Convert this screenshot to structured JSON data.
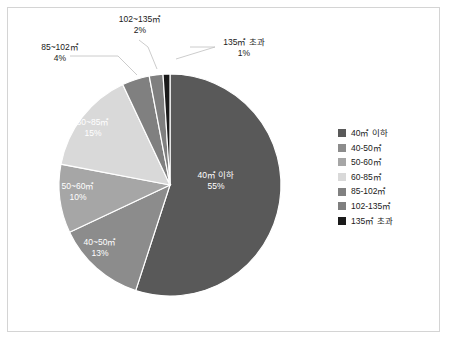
{
  "chart_data": {
    "type": "pie",
    "title": "",
    "categories": [
      "40㎡ 이하",
      "40~50㎡",
      "50~60㎡",
      "60~85㎡",
      "85~102㎡",
      "102~135㎡",
      "135㎡ 초과"
    ],
    "values": [
      55,
      13,
      10,
      15,
      4,
      2,
      1
    ],
    "value_labels": [
      "55%",
      "13%",
      "10%",
      "15%",
      "4%",
      "2%",
      "1%"
    ],
    "units": "percent",
    "start_angle_deg": 0,
    "direction": "clockwise",
    "legend_position": "right",
    "grid": false,
    "colors": [
      "#595959",
      "#8c8c8c",
      "#a6a6a6",
      "#d9d9d9",
      "#808080",
      "#7f7f7f",
      "#1a1a1a"
    ],
    "slices": [
      {
        "label": "40㎡ 이하",
        "value": 55,
        "pct_text": "55%",
        "color": "#595959",
        "label_placement": "inside"
      },
      {
        "label": "40~50㎡",
        "value": 13,
        "pct_text": "13%",
        "color": "#8c8c8c",
        "label_placement": "inside"
      },
      {
        "label": "50~60㎡",
        "value": 10,
        "pct_text": "10%",
        "color": "#a6a6a6",
        "label_placement": "inside"
      },
      {
        "label": "60~85㎡",
        "value": 15,
        "pct_text": "15%",
        "color": "#d9d9d9",
        "label_placement": "inside"
      },
      {
        "label": "85~102㎡",
        "value": 4,
        "pct_text": "4%",
        "color": "#808080",
        "label_placement": "outside"
      },
      {
        "label": "102~135㎡",
        "value": 2,
        "pct_text": "2%",
        "color": "#7f7f7f",
        "label_placement": "outside"
      },
      {
        "label": "135㎡ 초과",
        "value": 1,
        "pct_text": "1%",
        "color": "#1a1a1a",
        "label_placement": "outside"
      }
    ]
  },
  "labels": {
    "inside": [
      {
        "name": "40㎡ 이하",
        "pct": "55%"
      },
      {
        "name": "40~50㎡",
        "pct": "13%"
      },
      {
        "name": "50~60㎡",
        "pct": "10%"
      },
      {
        "name": "60~85㎡",
        "pct": "15%"
      }
    ],
    "outside": [
      {
        "name": "85~102㎡",
        "pct": "4%"
      },
      {
        "name": "102~135㎡",
        "pct": "2%"
      },
      {
        "name": "135㎡ 초과",
        "pct": "1%"
      }
    ]
  },
  "legend": {
    "items": [
      {
        "label": "40㎡ 이하",
        "color": "#595959"
      },
      {
        "label": "40-50㎡",
        "color": "#8c8c8c"
      },
      {
        "label": "50-60㎡",
        "color": "#a6a6a6"
      },
      {
        "label": "60-85㎡",
        "color": "#d9d9d9"
      },
      {
        "label": "85-102㎡",
        "color": "#808080"
      },
      {
        "label": "102-135㎡",
        "color": "#7f7f7f"
      },
      {
        "label": "135㎡ 초과",
        "color": "#1a1a1a"
      }
    ]
  },
  "frame": {
    "border_color": "#d4d4d4",
    "background": "#ffffff"
  }
}
